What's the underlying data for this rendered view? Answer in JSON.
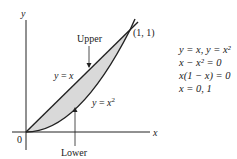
{
  "figure": {
    "axes": {
      "x_label": "x",
      "y_label": "y",
      "origin_label": "0"
    },
    "curves": [
      {
        "name": "upper",
        "equation": "y = x"
      },
      {
        "name": "lower",
        "equation": "y = x²"
      }
    ],
    "annotations": {
      "upper": "Upper",
      "lower": "Lower",
      "intersection": "(1, 1)",
      "line_label_lhs": "y",
      "line_label_rhs": "x",
      "parabola_label_lhs": "y",
      "parabola_label_rhs": "x"
    },
    "colors": {
      "shading": "#d9d9d9",
      "stroke": "#222222"
    }
  },
  "equations": [
    "y = x, y = x²",
    "x − x² = 0",
    "x(1 − x) = 0",
    "x = 0, 1"
  ]
}
